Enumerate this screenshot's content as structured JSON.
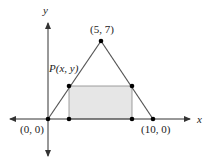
{
  "diagram": {
    "axes": {
      "x_label": "x",
      "y_label": "y"
    },
    "points": {
      "origin_label": "(0, 0)",
      "apex_label": "(5, 7)",
      "right_base_label": "(10, 0)",
      "p_label": "P(x, y)"
    },
    "shapes": {
      "triangle": {
        "vertices": [
          [
            0,
            0
          ],
          [
            5,
            7
          ],
          [
            10,
            0
          ]
        ]
      },
      "rectangle": {
        "description": "inscribed rectangle with top-left corner at P(x, y)",
        "fill": "#e6e6e6"
      }
    },
    "colors": {
      "line": "#555555",
      "axis": "#333333",
      "point": "#000000",
      "rect_fill": "#e6e6e6"
    }
  }
}
